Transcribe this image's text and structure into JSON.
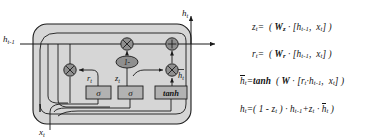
{
  "figure": {
    "type": "gru-cell-diagram",
    "title": "",
    "colors": {
      "cell_fill": "#d4d4d4",
      "node_fill": "#9a9a9a",
      "gate_fill": "#b0b0b0",
      "stroke": "#1a1a1a",
      "background": "#ffffff"
    }
  },
  "diagram": {
    "inputs": [
      {
        "id": "h-prev",
        "label": "h",
        "sub": "t-1",
        "x": 8,
        "y": 44
      },
      {
        "id": "x-input",
        "label": "x",
        "sub": "t",
        "x": 40,
        "y": 128
      }
    ],
    "outputs": [
      {
        "id": "h-out-top",
        "label": "h",
        "sub": "t",
        "x": 194,
        "y": 14
      }
    ],
    "gates": [
      {
        "id": "reset-gate",
        "label": "σ",
        "name": "sigma-reset"
      },
      {
        "id": "update-gate",
        "label": "σ",
        "name": "sigma-update"
      },
      {
        "id": "candidate-gate",
        "label": "tanh",
        "name": "tanh-candidate"
      }
    ],
    "operators": [
      {
        "id": "mul-reset",
        "symbol": "⊗",
        "name": "multiply-node"
      },
      {
        "id": "mul-update",
        "symbol": "⊗",
        "name": "multiply-node"
      },
      {
        "id": "mul-candidate",
        "symbol": "⊗",
        "name": "multiply-node"
      },
      {
        "id": "add-node",
        "symbol": "⊕",
        "name": "add-node"
      },
      {
        "id": "one-minus",
        "symbol": "1-",
        "name": "one-minus-node"
      }
    ],
    "signal_labels": [
      {
        "id": "r-t",
        "label": "r",
        "sub": "t"
      },
      {
        "id": "z-t",
        "label": "z",
        "sub": "t"
      },
      {
        "id": "h-tilde",
        "label": "h",
        "sub": "t",
        "overline": true
      }
    ]
  },
  "equations": [
    {
      "id": "eq-z",
      "text": "z_t =  ( W_z · [h_{t-1},  x_t] )",
      "lhs": "z",
      "lhs_sub": "t"
    },
    {
      "id": "eq-r",
      "text": "r_t =  ( W_r · [h_{t-1},  x_t] )",
      "lhs": "r",
      "lhs_sub": "t"
    },
    {
      "id": "eq-h-tilde",
      "text": "h̄_t = tanh ( W · [r_t · h_{t-1},  x_t] )",
      "lhs": "h",
      "lhs_sub": "t"
    },
    {
      "id": "eq-h",
      "text": "h_t = ( 1 - z_t ) · h_{t-1} + z_t · h̄_t )",
      "lhs": "h",
      "lhs_sub": "t"
    }
  ]
}
